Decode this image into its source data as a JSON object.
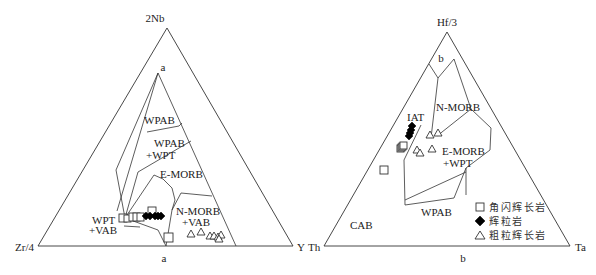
{
  "diagram_a": {
    "panel_label": "a",
    "apex_label": "2Nb",
    "left_label": "Zr/4",
    "right_label": "Y",
    "inner_apex_label": "a",
    "fields": {
      "wpab": "WPAB",
      "wpab_wpt_1": "WPAB",
      "wpab_wpt_2": "+WPT",
      "emorb": "E-MORB",
      "nmorb_vab_1": "N-MORB",
      "nmorb_vab_2": "+VAB",
      "wpt_vab_1": "WPT",
      "wpt_vab_2": "+VAB"
    }
  },
  "diagram_b": {
    "panel_label": "b",
    "apex_label": "Hf/3",
    "left_label": "Th",
    "right_label": "Ta",
    "inner_apex_label": "b",
    "fields": {
      "iat": "IAT",
      "nmorb": "N-MORB",
      "emorb_wpt_1": "E-MORB",
      "emorb_wpt_2": "+WPT",
      "wpab": "WPAB",
      "cab": "CAB"
    }
  },
  "legend": {
    "items": [
      {
        "symbol": "open-square",
        "label": "角闪辉长岩"
      },
      {
        "symbol": "filled-diamond",
        "label": "辉粒岩"
      },
      {
        "symbol": "open-triangle",
        "label": "粗粒辉长岩"
      }
    ]
  }
}
